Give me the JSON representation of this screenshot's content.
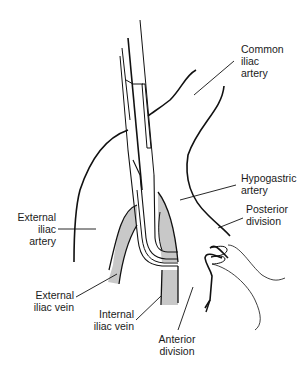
{
  "diagram": {
    "type": "anatomical-line-drawing",
    "colors": {
      "line": "#111111",
      "vein_fill": "#c8c8c8",
      "background": "#ffffff",
      "text": "#1a1a1a"
    },
    "labels": {
      "common_iliac_artery": [
        "Common",
        "iliac",
        "artery"
      ],
      "hypogastric_artery": [
        "Hypogastric",
        "artery"
      ],
      "posterior_division": [
        "Posterior",
        "division"
      ],
      "external_iliac_artery": [
        "External",
        "iliac",
        "artery"
      ],
      "external_iliac_vein": [
        "External",
        "iliac vein"
      ],
      "internal_iliac_vein": [
        "Internal",
        "iliac vein"
      ],
      "anterior_division": [
        "Anterior",
        "division"
      ]
    }
  }
}
